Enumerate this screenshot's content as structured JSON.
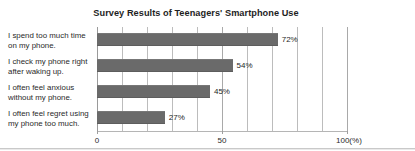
{
  "chart_data": {
    "type": "bar",
    "orientation": "horizontal",
    "title": "Survey Results of Teenagers' Smartphone Use",
    "xlabel": "",
    "ylabel": "",
    "xlim": [
      0,
      100
    ],
    "grid": true,
    "grid_axis": "x",
    "legend": false,
    "bar_color": "#6a6a6a",
    "gridline_color": "#bcbcbc",
    "categories": [
      "I spend too much time on my phone.",
      "I check my phone right after waking up.",
      "I often feel anxious without my phone.",
      "I often feel regret using my phone too much."
    ],
    "category_lines": [
      [
        "I spend too much time",
        "on my phone."
      ],
      [
        "I check my phone right",
        "after waking up."
      ],
      [
        "I often feel anxious",
        "without my phone."
      ],
      [
        "I often feel regret using",
        "my phone too much."
      ]
    ],
    "values": [
      72,
      54,
      45,
      27
    ],
    "value_labels": [
      "72%",
      "54%",
      "45%",
      "27%"
    ],
    "xticks": [
      0,
      50,
      100
    ],
    "xtick_labels": [
      "0",
      "50",
      "100"
    ],
    "x_unit_label": "(%)",
    "x_last_tick_label": "100(%)"
  }
}
